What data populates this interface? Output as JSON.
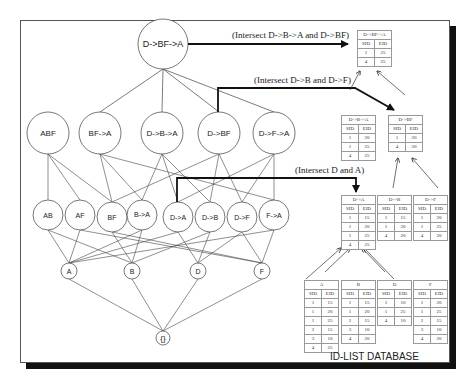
{
  "nodes": {
    "top": {
      "label": "D->BF->A"
    },
    "level2": [
      {
        "id": "ABF",
        "label": "ABF"
      },
      {
        "id": "BF->A",
        "label": "BF->A"
      },
      {
        "id": "D->B->A",
        "label": "D->B->A"
      },
      {
        "id": "D->BF",
        "label": "D->BF"
      },
      {
        "id": "D->F->A",
        "label": "D->F->A"
      }
    ],
    "level1": [
      {
        "id": "AB",
        "label": "AB"
      },
      {
        "id": "AF",
        "label": "AF"
      },
      {
        "id": "BF",
        "label": "BF"
      },
      {
        "id": "B->A",
        "label": "B->A"
      },
      {
        "id": "D->A",
        "label": "D->A"
      },
      {
        "id": "D->B",
        "label": "D->B"
      },
      {
        "id": "D->F",
        "label": "D->F"
      },
      {
        "id": "F->A",
        "label": "F->A"
      }
    ],
    "level0": [
      {
        "id": "A",
        "label": "A"
      },
      {
        "id": "B",
        "label": "B"
      },
      {
        "id": "D",
        "label": "D"
      },
      {
        "id": "F",
        "label": "F"
      }
    ],
    "root": {
      "label": "{}"
    }
  },
  "annotations": {
    "intersect_top": "(Intersect D->B->A and D->BF)",
    "intersect_mid": "(Intersect D->B and D->F)",
    "intersect_low": "(Intersect D and A)"
  },
  "tables": {
    "dbfa": {
      "title": "D->BF->A",
      "cols": [
        "SID",
        "EID"
      ],
      "rows": [
        [
          "1",
          "25"
        ],
        [
          "4",
          "25"
        ]
      ]
    },
    "dba": {
      "title": "D->B->A",
      "cols": [
        "SID",
        "EID"
      ],
      "rows": [
        [
          "1",
          "20"
        ],
        [
          "1",
          "25"
        ],
        [
          "4",
          "25"
        ]
      ]
    },
    "dbf": {
      "title": "D->BF",
      "cols": [
        "SID",
        "EID"
      ],
      "rows": [
        [
          "1",
          "20"
        ],
        [
          "4",
          "20"
        ]
      ]
    },
    "da": {
      "title": "D->A",
      "cols": [
        "SID",
        "EID"
      ],
      "rows": [
        [
          "1",
          "15"
        ],
        [
          "1",
          "20"
        ],
        [
          "1",
          "25"
        ],
        [
          "4",
          "25"
        ]
      ]
    },
    "db": {
      "title": "D->B",
      "cols": [
        "SID",
        "EID"
      ],
      "rows": [
        [
          "1",
          "15"
        ],
        [
          "1",
          "20"
        ],
        [
          "4",
          "20"
        ]
      ]
    },
    "df": {
      "title": "D->F",
      "cols": [
        "SID",
        "EID"
      ],
      "rows": [
        [
          "1",
          "20"
        ],
        [
          "1",
          "25"
        ],
        [
          "4",
          "20"
        ]
      ]
    },
    "a": {
      "title": "A",
      "cols": [
        "SID",
        "EID"
      ],
      "rows": [
        [
          "1",
          "15"
        ],
        [
          "1",
          "20"
        ],
        [
          "1",
          "25"
        ],
        [
          "2",
          "15"
        ],
        [
          "3",
          "10"
        ],
        [
          "4",
          "25"
        ]
      ]
    },
    "b": {
      "title": "B",
      "cols": [
        "SID",
        "EID"
      ],
      "rows": [
        [
          "1",
          "15"
        ],
        [
          "1",
          "20"
        ],
        [
          "2",
          "15"
        ],
        [
          "3",
          "10"
        ],
        [
          "4",
          "20"
        ]
      ]
    },
    "d": {
      "title": "D",
      "cols": [
        "SID",
        "EID"
      ],
      "rows": [
        [
          "1",
          "10"
        ],
        [
          "1",
          "25"
        ],
        [
          "4",
          "10"
        ]
      ]
    },
    "f": {
      "title": "F",
      "cols": [
        "SID",
        "EID"
      ],
      "rows": [
        [
          "1",
          "20"
        ],
        [
          "1",
          "25"
        ],
        [
          "2",
          "15"
        ],
        [
          "3",
          "10"
        ],
        [
          "4",
          "20"
        ]
      ]
    }
  },
  "database_label": "ID-LIST DATABASE",
  "colors": {
    "line": "#444444",
    "arrow": "#111111",
    "shadow": "#111111"
  }
}
